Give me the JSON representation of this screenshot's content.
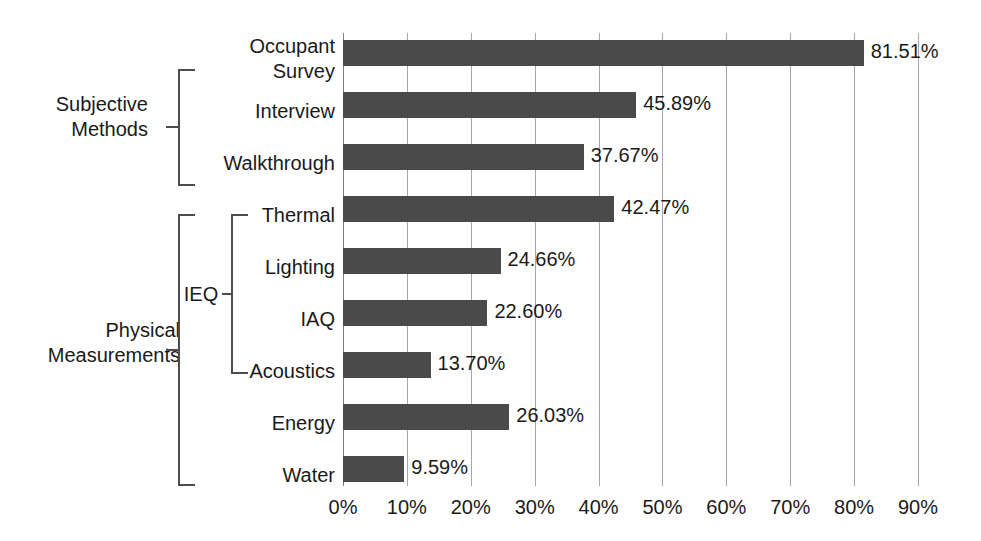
{
  "chart_data": {
    "type": "bar",
    "orientation": "horizontal",
    "title": "",
    "xlabel": "",
    "ylabel": "",
    "xlim": [
      0,
      90
    ],
    "grid": true,
    "legend": false,
    "categories": [
      "Occupant\nSurvey",
      "Interview",
      "Walkthrough",
      "Thermal",
      "Lighting",
      "IAQ",
      "Acoustics",
      "Energy",
      "Water"
    ],
    "values": [
      81.51,
      45.89,
      37.67,
      42.47,
      24.66,
      22.6,
      13.7,
      26.03,
      9.59
    ],
    "value_labels": [
      "81.51%",
      "45.89%",
      "37.67%",
      "42.47%",
      "24.66%",
      "22.60%",
      "13.70%",
      "26.03%",
      "9.59%"
    ],
    "xticks": [
      0,
      10,
      20,
      30,
      40,
      50,
      60,
      70,
      80,
      90
    ],
    "xtick_labels": [
      "0%",
      "10%",
      "20%",
      "30%",
      "40%",
      "50%",
      "60%",
      "70%",
      "80%",
      "90%"
    ],
    "bar_color": "#4a4a4a",
    "gridline_color": "#a6a6a6",
    "text_color": "#1a1a1a",
    "background_color": "#ffffff"
  },
  "groups": {
    "subjective": {
      "label": "Subjective\nMethods",
      "members": [
        "Occupant Survey",
        "Interview",
        "Walkthrough"
      ]
    },
    "physical": {
      "label": "Physical\nMeasurements",
      "members": [
        "Thermal",
        "Lighting",
        "IAQ",
        "Acoustics",
        "Energy",
        "Water"
      ]
    },
    "ieq": {
      "label": "IEQ",
      "members": [
        "Thermal",
        "Lighting",
        "IAQ",
        "Acoustics"
      ]
    }
  }
}
